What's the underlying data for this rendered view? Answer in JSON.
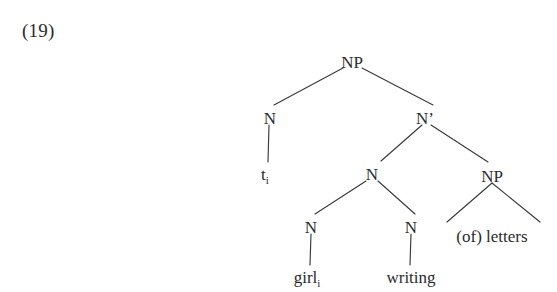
{
  "figure": {
    "example_number": "(19)",
    "background_color": "#ffffff",
    "ink_color": "#2b2b2b",
    "line_color": "#3a3a3a"
  },
  "tree": {
    "type": "syntax-tree",
    "nodes": {
      "root_np": {
        "label": "NP",
        "x": 352,
        "y": 62
      },
      "left_n": {
        "label": "N",
        "x": 270,
        "y": 118
      },
      "nbar": {
        "label": "N’",
        "x": 425,
        "y": 118
      },
      "trace": {
        "label": "t",
        "subscript": "i",
        "x": 268,
        "y": 176
      },
      "mid_n": {
        "label": "N",
        "x": 372,
        "y": 174
      },
      "right_np": {
        "label": "NP",
        "x": 492,
        "y": 176
      },
      "girl_n": {
        "label": "N",
        "x": 311,
        "y": 227
      },
      "writing_n": {
        "label": "N",
        "x": 411,
        "y": 227
      },
      "girl_leaf": {
        "label": "girl",
        "subscript": "i",
        "x": 310,
        "y": 279
      },
      "writing_leaf": {
        "label": "writing",
        "x": 411,
        "y": 279
      },
      "of_letters_leaf": {
        "label": "(of) letters",
        "x": 492,
        "y": 237
      }
    },
    "edges": [
      {
        "name": "edge-root-np-to-left-n",
        "x1": 343,
        "y1": 68,
        "x2": 274,
        "y2": 105
      },
      {
        "name": "edge-root-np-to-nbar",
        "x1": 362,
        "y1": 68,
        "x2": 433,
        "y2": 105
      },
      {
        "name": "edge-left-n-to-trace",
        "x1": 269,
        "y1": 125,
        "x2": 268,
        "y2": 162
      },
      {
        "name": "edge-nbar-to-mid-n",
        "x1": 422,
        "y1": 125,
        "x2": 381,
        "y2": 161
      },
      {
        "name": "edge-nbar-to-right-np",
        "x1": 431,
        "y1": 125,
        "x2": 488,
        "y2": 162
      },
      {
        "name": "edge-mid-n-to-girl-n",
        "x1": 366,
        "y1": 181,
        "x2": 315,
        "y2": 214
      },
      {
        "name": "edge-mid-n-to-writing-n",
        "x1": 378,
        "y1": 181,
        "x2": 415,
        "y2": 214
      },
      {
        "name": "edge-girl-n-to-girl-leaf",
        "x1": 311,
        "y1": 234,
        "x2": 310,
        "y2": 265
      },
      {
        "name": "edge-writing-n-to-writing-leaf",
        "x1": 411,
        "y1": 234,
        "x2": 410,
        "y2": 265
      }
    ],
    "triangle": {
      "name": "triangle-of-letters",
      "apex_x": 492,
      "apex_y": 183,
      "left_x": 447,
      "left_y": 222,
      "right_x": 540,
      "right_y": 222
    }
  }
}
